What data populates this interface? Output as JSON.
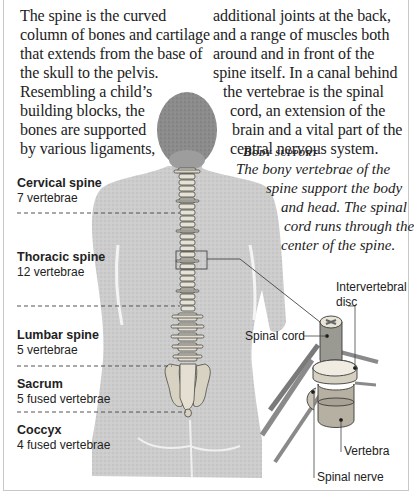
{
  "intro_text": {
    "left_column": [
      "The spine is the curved",
      "column of bones and cartilage",
      "that extends from the base of",
      "the skull to the pelvis.",
      "Resembling a child’s",
      "building blocks, the",
      "bones are supported",
      "by various ligaments,"
    ],
    "right_column": [
      "additional joints at the back,",
      "and a range of muscles both",
      "around and in front of the",
      "spine itself. In a canal behind",
      "the vertebrae is the spinal",
      "cord, an extension of the",
      "brain and a vital part of the",
      "central nervous system."
    ]
  },
  "caption": {
    "title": "Body support",
    "lines": [
      "The bony vertebrae of the",
      "spine support the body",
      "and head. The spinal",
      "cord runs through the",
      "center of the spine."
    ]
  },
  "spine_regions": [
    {
      "name": "Cervical spine",
      "count": "7 vertebrae"
    },
    {
      "name": "Thoracic spine",
      "count": "12 vertebrae"
    },
    {
      "name": "Lumbar spine",
      "count": "5 vertebrae"
    },
    {
      "name": "Sacrum",
      "count": "5 fused vertebrae"
    },
    {
      "name": "Coccyx",
      "count": "4 fused vertebrae"
    }
  ],
  "detail_labels": {
    "disc_line1": "Intervertebral",
    "disc_line2": "disc",
    "spinal_cord": "Spinal cord",
    "vertebra": "Vertebra",
    "spinal_nerve": "Spinal nerve"
  },
  "colors": {
    "body_fill": "#c9c9c9",
    "head_fill": "#8a8a8a",
    "bone": "#e8e4da",
    "text": "#222222"
  }
}
